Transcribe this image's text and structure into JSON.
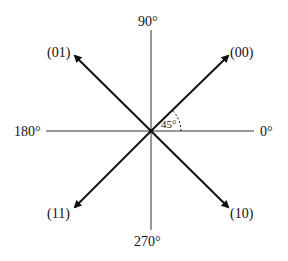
{
  "diagram": {
    "type": "constellation",
    "axes": {
      "top": "90°",
      "bottom": "270°",
      "left": "180°",
      "right": "0°"
    },
    "points": [
      {
        "label": "(00)",
        "angle_deg": 45
      },
      {
        "label": "(01)",
        "angle_deg": 135
      },
      {
        "label": "(11)",
        "angle_deg": 225
      },
      {
        "label": "(10)",
        "angle_deg": 315
      }
    ],
    "angle_annotation": "45°",
    "colors": {
      "line": "#111111",
      "axis": "#333333"
    }
  }
}
